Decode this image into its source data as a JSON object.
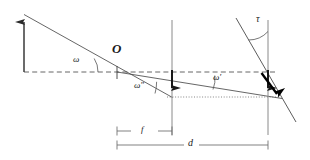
{
  "figure": {
    "type": "optics-ray-diagram",
    "width": 310,
    "height": 160,
    "background_color": "#ffffff",
    "line_color": "#4a4a4a",
    "bold_line_color": "#000000",
    "text_color": "#1a1a1a"
  },
  "labels": {
    "angle_omega": "ω",
    "angle_omega_prime": "ω′",
    "angle_omega_double_prime": "ω″",
    "angle_tau": "τ",
    "optical_center": "O",
    "dim_focal_length": "f",
    "dim_distance": "d"
  },
  "geometry": {
    "optical_axis": {
      "x1": 24,
      "y1": 72,
      "x2": 276,
      "y2": 72,
      "style": "dashed"
    },
    "dotted_image_line": {
      "x1": 167,
      "y1": 97,
      "x2": 279,
      "y2": 97,
      "style": "dotted"
    },
    "object_arrow": {
      "x": 24,
      "y_base": 72,
      "y_tip": 14
    },
    "chief_ray_in": {
      "x1": 24,
      "y1": 14,
      "x2": 172,
      "y2": 97
    },
    "chief_ray_out": {
      "x1": 117,
      "y1": 72,
      "x2": 281,
      "y2": 98
    },
    "lens_plane": {
      "x": 172,
      "y1": 20,
      "y2": 135
    },
    "image_plane": {
      "x": 268,
      "y1": 20,
      "y2": 135
    },
    "tilted_plane": {
      "x1": 236,
      "y1": 18,
      "x2": 296,
      "y2": 122
    },
    "lens_image_arrow": {
      "x": 172,
      "y_top": 70,
      "y_tip": 97
    },
    "focal_image_arrow": {
      "x": 268,
      "y_top": 70,
      "y_tip": 97
    },
    "tilted_image_arrow": {
      "x1": 262,
      "y1": 74,
      "x2": 281,
      "y2": 100
    },
    "dim_f": {
      "x1": 117,
      "x2": 172,
      "y": 131
    },
    "dim_d": {
      "x1": 117,
      "x2": 268,
      "y": 145
    }
  }
}
